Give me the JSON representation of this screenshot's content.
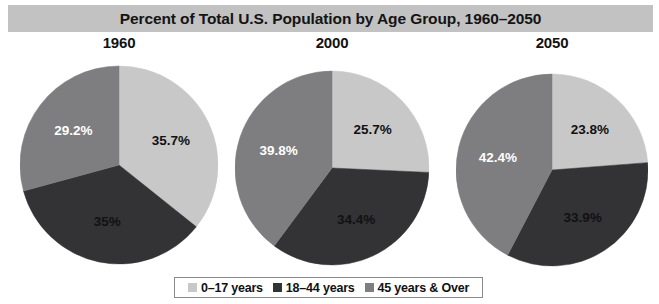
{
  "title": "Percent of Total U.S. Population by Age Group, 1960–2050",
  "colors": {
    "light_gray": "#c8c8c8",
    "dark_gray": "#333335",
    "medium_gray": "#7e7e80",
    "title_bar": "#c2c2c2",
    "background": "#ffffff",
    "legend_border": "#8a8a8a"
  },
  "legend": {
    "items": [
      {
        "label": "0–17 years",
        "color": "#c8c8c8",
        "swatch_name": "legend-swatch-0-17"
      },
      {
        "label": "18–44 years",
        "color": "#333335",
        "swatch_name": "legend-swatch-18-44"
      },
      {
        "label": "45 years & Over",
        "color": "#7e7e80",
        "swatch_name": "legend-swatch-45-over"
      }
    ]
  },
  "chart_data": {
    "type": "pie",
    "title": "Percent of Total U.S. Population by Age Group, 1960–2050",
    "xlabel": "",
    "ylabel": "",
    "legend_position": "bottom",
    "grid": false,
    "categories": [
      "0–17 years",
      "18–44 years",
      "45 years & Over"
    ],
    "charts": [
      {
        "title": "1960",
        "labels": [
          "35.7%",
          "35%",
          "29.2%"
        ],
        "values": [
          35.7,
          35.0,
          29.2
        ],
        "colors": [
          "#c8c8c8",
          "#333335",
          "#7e7e80"
        ],
        "label_colors": [
          "#111111",
          "#111111",
          "#ffffff"
        ]
      },
      {
        "title": "2000",
        "labels": [
          "25.7%",
          "34.4%",
          "39.8%"
        ],
        "values": [
          25.7,
          34.4,
          39.8
        ],
        "colors": [
          "#c8c8c8",
          "#333335",
          "#7e7e80"
        ],
        "label_colors": [
          "#111111",
          "#111111",
          "#ffffff"
        ]
      },
      {
        "title": "2050",
        "labels": [
          "23.8%",
          "33.9%",
          "42.4%"
        ],
        "values": [
          23.8,
          33.9,
          42.4
        ],
        "colors": [
          "#c8c8c8",
          "#333335",
          "#7e7e80"
        ],
        "label_colors": [
          "#111111",
          "#111111",
          "#ffffff"
        ]
      }
    ],
    "layout": [
      {
        "cx": 119,
        "cy": 131,
        "r": 99,
        "block_left": 20,
        "block_width": 198,
        "label_radius_factor": 0.58
      },
      {
        "cx": 332,
        "cy": 134,
        "r": 97,
        "block_left": 235,
        "block_width": 194,
        "label_radius_factor": 0.58
      },
      {
        "cx": 552,
        "cy": 136,
        "r": 96,
        "block_left": 456,
        "block_width": 192,
        "label_radius_factor": 0.58
      }
    ]
  }
}
